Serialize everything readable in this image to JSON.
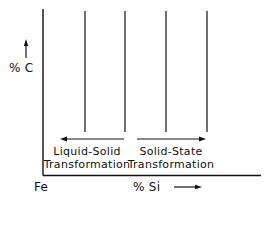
{
  "diagram": {
    "y_axis": {
      "label": "% C",
      "arrow": "up"
    },
    "x_axis": {
      "origin_label": "Fe",
      "label": "% Si",
      "arrow": "right"
    },
    "regions": [
      {
        "line1": "Liquid-Solid",
        "line2": "Transformation",
        "arrow": "left"
      },
      {
        "line1": "Solid-State",
        "line2": "Transformation",
        "arrow": "right"
      }
    ],
    "vertical_lines": 4,
    "colors": {
      "ink": "#111111",
      "background": "#ffffff"
    }
  }
}
